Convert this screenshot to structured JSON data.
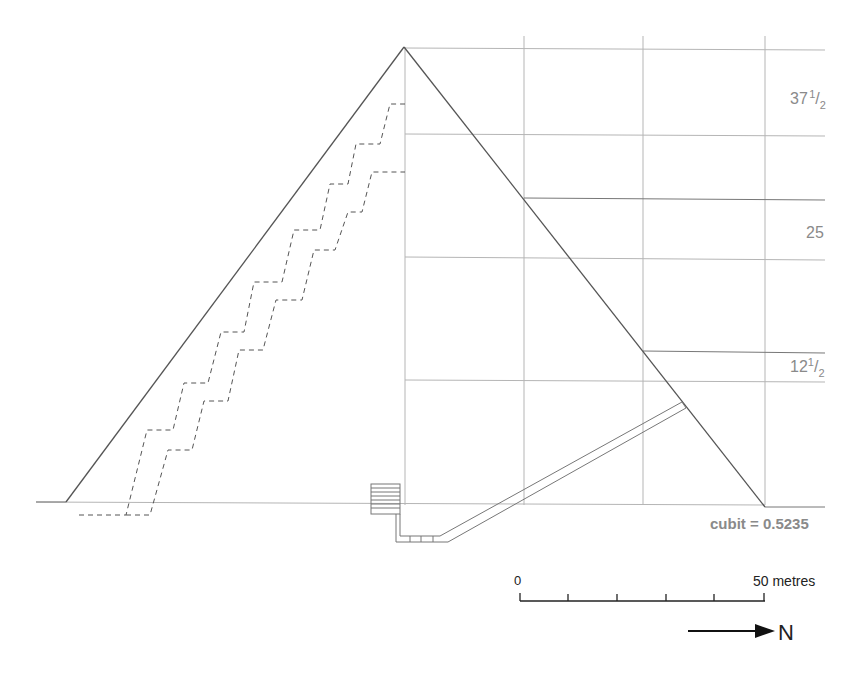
{
  "diagram": {
    "type": "pyramid cross-section",
    "grid_labels": {
      "label_top": {
        "whole": "37",
        "num": "1",
        "den": "2"
      },
      "label_mid": "25",
      "label_low": {
        "whole": "12",
        "num": "1",
        "den": "2"
      }
    },
    "cubit_note": "cubit = 0.5235",
    "scale_bar": {
      "start_label": "0",
      "end_label": "50 metres",
      "ticks": 6
    },
    "north_arrow": {
      "label": "N"
    },
    "colors": {
      "outline": "#555555",
      "grid": "#b0b0b0",
      "label": "#8a8a8a",
      "scale": "#222222"
    }
  }
}
